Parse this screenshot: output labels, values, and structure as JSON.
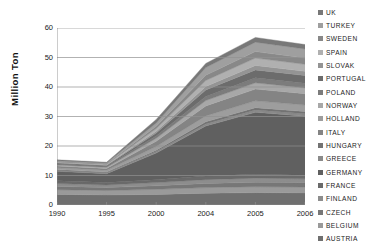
{
  "chart_data": {
    "type": "area",
    "stacked": true,
    "title": "",
    "xlabel": "",
    "ylabel": "Million Ton",
    "x": [
      "1990",
      "1995",
      "2000",
      "2004",
      "2005",
      "2006"
    ],
    "xticklabels": [
      "1990",
      "1995",
      "2000",
      "2004",
      "2005",
      "2006"
    ],
    "yticklabels": [
      "0",
      "10",
      "20",
      "30",
      "40",
      "50",
      "60"
    ],
    "ylim": [
      0,
      60
    ],
    "ytick_step": 10,
    "grid": "horizontal",
    "legend_position": "right",
    "series": [
      {
        "name": "AUSTRIA",
        "color": "#6f6f6f",
        "values": [
          3.6,
          3.4,
          3.6,
          4.0,
          4.2,
          4.1
        ]
      },
      {
        "name": "BELGIUM",
        "color": "#9a9a9a",
        "values": [
          1.6,
          1.5,
          1.7,
          1.9,
          2.0,
          2.0
        ]
      },
      {
        "name": "CZECH",
        "color": "#777777",
        "values": [
          1.1,
          1.0,
          1.2,
          1.4,
          1.5,
          1.5
        ]
      },
      {
        "name": "FINLAND",
        "color": "#8d8d8d",
        "values": [
          1.0,
          0.9,
          1.1,
          1.3,
          1.4,
          1.3
        ]
      },
      {
        "name": "FRANCE",
        "color": "#6a6a6a",
        "values": [
          0.9,
          0.8,
          1.0,
          1.2,
          1.3,
          1.2
        ]
      },
      {
        "name": "GERMANY",
        "color": "#606060",
        "values": [
          3.2,
          3.0,
          9.0,
          17.0,
          21.0,
          20.0
        ]
      },
      {
        "name": "GREECE",
        "color": "#8a8a8a",
        "values": [
          0.3,
          0.3,
          0.5,
          0.7,
          0.8,
          0.8
        ]
      },
      {
        "name": "HUNGARY",
        "color": "#737373",
        "values": [
          0.3,
          0.3,
          0.5,
          0.7,
          0.8,
          0.8
        ]
      },
      {
        "name": "HOLLAND",
        "color": "#9d9d9d",
        "values": [
          0.6,
          0.6,
          1.2,
          2.0,
          2.3,
          2.2
        ]
      },
      {
        "name": "ITALY",
        "color": "#848484",
        "values": [
          0.6,
          0.6,
          1.8,
          3.4,
          4.0,
          3.8
        ]
      },
      {
        "name": "NORWAY",
        "color": "#a8a8a8",
        "values": [
          0.4,
          0.4,
          1.0,
          1.8,
          2.1,
          2.0
        ]
      },
      {
        "name": "POLAND",
        "color": "#7c7c7c",
        "values": [
          0.3,
          0.3,
          0.8,
          1.4,
          1.7,
          1.6
        ]
      },
      {
        "name": "PORTUGAL",
        "color": "#6c6c6c",
        "values": [
          0.3,
          0.3,
          1.0,
          2.2,
          2.7,
          2.6
        ]
      },
      {
        "name": "SLOVAK",
        "color": "#949494",
        "values": [
          0.2,
          0.2,
          0.6,
          1.2,
          1.5,
          1.4
        ]
      },
      {
        "name": "SPAIN",
        "color": "#b0b0b0",
        "values": [
          0.2,
          0.2,
          0.9,
          2.0,
          2.5,
          2.4
        ]
      },
      {
        "name": "SWEDEN",
        "color": "#888888",
        "values": [
          0.2,
          0.2,
          0.8,
          1.8,
          2.2,
          2.1
        ]
      },
      {
        "name": "TURKEY",
        "color": "#9f9f9f",
        "values": [
          0.2,
          0.2,
          1.1,
          2.6,
          3.2,
          3.1
        ]
      },
      {
        "name": "UK",
        "color": "#787878",
        "values": [
          0.3,
          0.3,
          1.2,
          1.4,
          1.6,
          1.5
        ]
      }
    ],
    "totals": [
      15.3,
      14.5,
      29.0,
      48.0,
      56.8,
      54.4
    ]
  },
  "legend": {
    "items": [
      {
        "label": "UK",
        "color": "#787878"
      },
      {
        "label": "TURKEY",
        "color": "#9f9f9f"
      },
      {
        "label": "SWEDEN",
        "color": "#888888"
      },
      {
        "label": "SPAIN",
        "color": "#b0b0b0"
      },
      {
        "label": "SLOVAK",
        "color": "#949494"
      },
      {
        "label": "PORTUGAL",
        "color": "#6c6c6c"
      },
      {
        "label": "POLAND",
        "color": "#7c7c7c"
      },
      {
        "label": "NORWAY",
        "color": "#a8a8a8"
      },
      {
        "label": "HOLLAND",
        "color": "#9d9d9d"
      },
      {
        "label": "ITALY",
        "color": "#848484"
      },
      {
        "label": "HUNGARY",
        "color": "#737373"
      },
      {
        "label": "GREECE",
        "color": "#8a8a8a"
      },
      {
        "label": "GERMANY",
        "color": "#606060"
      },
      {
        "label": "FRANCE",
        "color": "#6a6a6a"
      },
      {
        "label": "FINLAND",
        "color": "#8d8d8d"
      },
      {
        "label": "CZECH",
        "color": "#777777"
      },
      {
        "label": "BELGIUM",
        "color": "#9a9a9a"
      },
      {
        "label": "AUSTRIA",
        "color": "#6f6f6f"
      }
    ]
  },
  "axis": {
    "y_title": "Million Ton",
    "axis_color": "#808080",
    "grid_color": "#909090"
  }
}
